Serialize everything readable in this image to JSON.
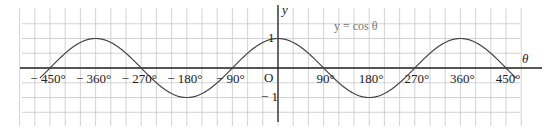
{
  "chart_data": {
    "type": "line",
    "title": "y = cos θ",
    "xlabel": "θ",
    "ylabel": "y",
    "function": "cos",
    "xlim": [
      -450,
      450
    ],
    "ylim": [
      -1,
      1
    ],
    "x_ticks": [
      "− 450°",
      "− 360°",
      "− 270°",
      "− 180°",
      "− 90°",
      "90°",
      "180°",
      "270°",
      "360°",
      "450°"
    ],
    "x_tick_values": [
      -450,
      -360,
      -270,
      -180,
      -90,
      90,
      180,
      270,
      360,
      450
    ],
    "y_ticks": [
      "1",
      "− 1"
    ],
    "y_tick_values": [
      1,
      -1
    ],
    "origin_label": "O",
    "grid": true,
    "series": [
      {
        "name": "y = cos θ",
        "x": [
          -450,
          -360,
          -270,
          -180,
          -90,
          0,
          90,
          180,
          270,
          360,
          450
        ],
        "values": [
          0,
          1,
          0,
          -1,
          0,
          1,
          0,
          -1,
          0,
          1,
          0
        ]
      }
    ]
  },
  "labels": {
    "curve": "y  =  cos θ",
    "y_axis": "y",
    "x_axis": "θ",
    "origin": "O",
    "one": "1",
    "minus_one": "− 1"
  },
  "colors": {
    "grid": "#c8c8c8",
    "axis": "#222222",
    "curve": "#444444"
  }
}
